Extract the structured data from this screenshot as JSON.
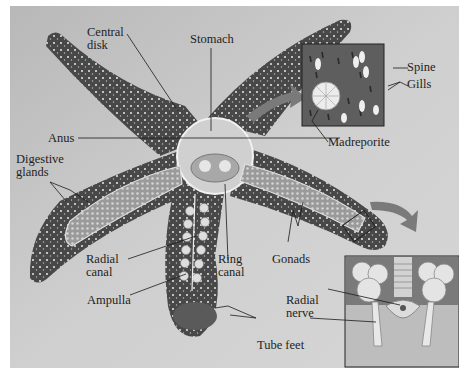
{
  "figure": {
    "colors": {
      "background_light": "#c9c9c9",
      "background_dark": "#9a9a9a",
      "body_dark": "#3c3c3c",
      "body_mid": "#6a6a6a",
      "organ_light": "#d8d8d8",
      "leader_line": "#1a1a1a",
      "arrow": "#7a7a7a"
    },
    "labels": {
      "central_disk": "Central\ndisk",
      "stomach": "Stomach",
      "anus": "Anus",
      "digestive_glands": "Digestive\nglands",
      "madreporite": "Madreporite",
      "spine": "Spine",
      "gills": "Gills",
      "radial_canal": "Radial\ncanal",
      "ring_canal": "Ring\ncanal",
      "gonads": "Gonads",
      "ampulla": "Ampulla",
      "radial_nerve": "Radial\nnerve",
      "tube_feet": "Tube feet"
    },
    "insets": [
      {
        "name": "madreporite-surface-detail",
        "shows": [
          "Spine",
          "Gills",
          "Madreporite"
        ]
      },
      {
        "name": "arm-cross-section-detail",
        "shows": [
          "Radial nerve",
          "Tube feet"
        ]
      }
    ]
  }
}
